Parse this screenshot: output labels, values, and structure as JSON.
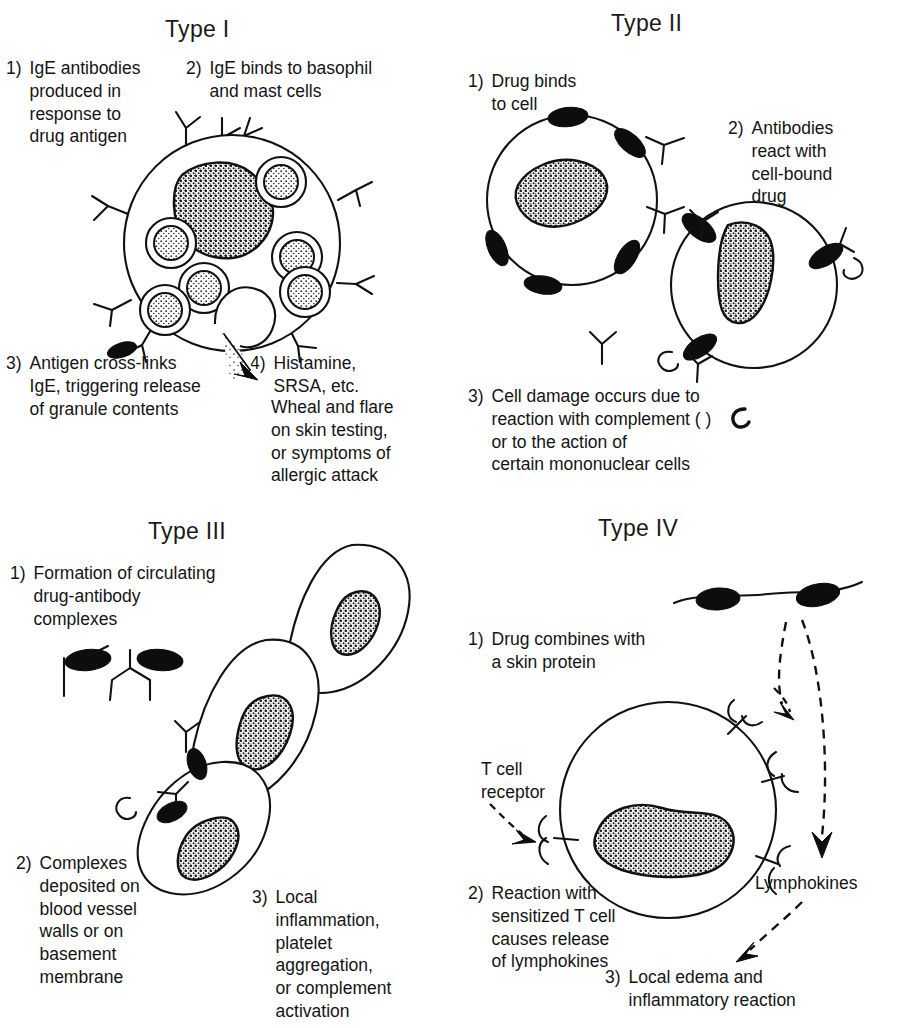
{
  "figure": {
    "background_color": "#ffffff",
    "ink_color": "#111111"
  },
  "panels": [
    {
      "id": "type-1",
      "title": "Type I",
      "steps": [
        {
          "num": "1)",
          "text": "IgE antibodies\nproduced in\nresponse to\ndrug antigen"
        },
        {
          "num": "2)",
          "text": "IgE binds to basophil\nand mast cells"
        },
        {
          "num": "3)",
          "text": "Antigen cross-links\nIgE, triggering release\nof granule contents"
        },
        {
          "num": "4)",
          "text": "Histamine,\nSRSA, etc."
        },
        {
          "num": "",
          "text": "Wheal and flare\non skin testing,\nor symptoms of\nallergic attack"
        }
      ],
      "art": {
        "cell_name": "mast-cell",
        "nucleus": "stippled-lobed-nucleus",
        "granule_count": 6,
        "igE_receptor_count": 7,
        "releasing_granule": true,
        "drug_antigen_marks": 1
      }
    },
    {
      "id": "type-2",
      "title": "Type II",
      "steps": [
        {
          "num": "1)",
          "text": "Drug binds\nto cell"
        },
        {
          "num": "2)",
          "text": "Antibodies\nreact with\ncell-bound\ndrug"
        },
        {
          "num": "3)",
          "text": "Cell damage occurs due to\nreaction with complement (  )\nor to the action of\ncertain mononuclear cells"
        }
      ],
      "art": {
        "cell_count": 2,
        "cell_name": "target-cell",
        "nucleus": "stippled-oval-nucleus",
        "drug_molecules_per_cell": 4,
        "free_antibodies": 2,
        "bound_antibodies": 2,
        "complement_symbols": 2
      }
    },
    {
      "id": "type-3",
      "title": "Type III",
      "steps": [
        {
          "num": "1)",
          "text": "Formation of circulating\ndrug-antibody\ncomplexes"
        },
        {
          "num": "2)",
          "text": "Complexes\ndeposited on\nblood vessel\nwalls or on\nbasement\nmembrane"
        },
        {
          "num": "3)",
          "text": "Local\ninflammation,\nplatelet\naggregation,\nor complement\nactivation"
        }
      ],
      "art": {
        "cell_count": 3,
        "cell_name": "endothelial-cell",
        "nucleus": "stippled-oval-nucleus",
        "free_complexes": 1,
        "deposited_complexes": 2,
        "complement_symbols": 1
      }
    },
    {
      "id": "type-4",
      "title": "Type IV",
      "steps": [
        {
          "num": "1)",
          "text": "Drug combines with\na skin protein"
        },
        {
          "num": "2)",
          "text": "Reaction with\nsensitized T cell\ncauses release\nof lymphokines"
        },
        {
          "num": "3)",
          "text": "Local edema and\ninflammatory reaction"
        }
      ],
      "labels": {
        "t_cell_receptor": "T cell\nreceptor",
        "cell_caption": "Sensitized T Cell",
        "lymphokines": "Lymphokines"
      },
      "art": {
        "cell_name": "sensitized-t-cell",
        "nucleus": "stippled-lobed-nucleus",
        "skin_protein_membrane": true,
        "drug_molecules_on_membrane": 2,
        "receptor_count": 4,
        "dashed_arrows": 3
      }
    }
  ]
}
